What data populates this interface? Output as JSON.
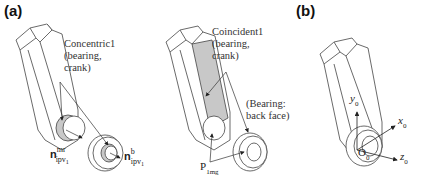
{
  "panels": {
    "a": {
      "label": "(a)",
      "left": {
        "annotation": "Concentric1\n(bearing,\ncrank)",
        "vector_mr": {
          "base": "n",
          "sup": "mr",
          "sub": "ipv",
          "subsub": "1"
        },
        "vector_b": {
          "base": "n",
          "sup": "b",
          "sub": "ipv",
          "subsub": "1"
        }
      },
      "right": {
        "annotation": "Coincident1\n(bearing,\ncrank)",
        "face_annotation": "(Bearing:\nback face)",
        "point_label": {
          "base": "P",
          "sub": "1mg"
        }
      }
    },
    "b": {
      "label": "(b)",
      "axes": {
        "y": "y",
        "x": "x",
        "z": "z",
        "origin": "O",
        "index": "0"
      }
    }
  },
  "colors": {
    "line": "#333333",
    "shade": "#c8c8c8",
    "background": "#ffffff"
  }
}
